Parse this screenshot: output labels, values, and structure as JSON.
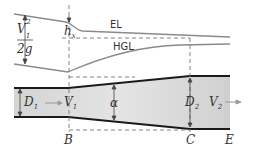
{
  "labels": {
    "el": "EL",
    "hgl": "HGL",
    "velocity_head_num": "V",
    "velocity_head_num_sub": "1",
    "velocity_head_num_sup": "2",
    "velocity_head_den": "2g",
    "head_loss": "h",
    "head_loss_sub": "x",
    "d1": "D",
    "d1_sub": "1",
    "v1": "V",
    "v1_sub": "1",
    "alpha": "α",
    "d2": "D",
    "d2_sub": "2",
    "v2": "V",
    "v2_sub": "2",
    "section_b": "B",
    "section_c": "C",
    "section_e": "E"
  },
  "colors": {
    "pipe_wall": "#1a1a1a",
    "fluid": "#d9d9d9",
    "lines": "#8a8a8a",
    "dashed": "#777777"
  }
}
